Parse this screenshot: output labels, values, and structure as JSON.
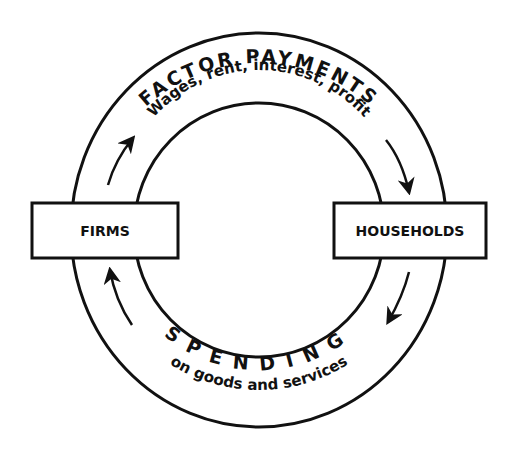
{
  "diagram": {
    "nodes": {
      "firms": {
        "label": "FIRMS"
      },
      "households": {
        "label": "HOUSEHOLDS"
      }
    },
    "flows": {
      "top": {
        "heading": "FACTOR PAYMENTS",
        "subheading": "Wages, rent, interest, profit",
        "direction": "firms-to-households"
      },
      "bottom": {
        "heading": "SPENDING",
        "subheading": "on goods and services",
        "direction": "households-to-firms"
      }
    },
    "colors": {
      "line": "#111111",
      "background": "#ffffff"
    }
  }
}
